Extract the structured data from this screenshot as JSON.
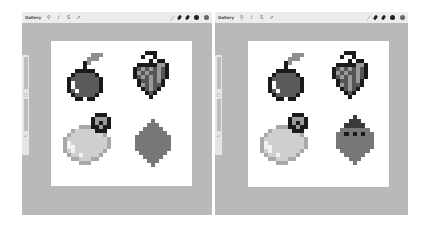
{
  "panes": [
    {
      "id": "left",
      "toolbar": {
        "gallery_label": "Gallery",
        "left_tools": [
          {
            "icon": "wrench-icon",
            "glyph": "⚲"
          },
          {
            "icon": "magic-wand-icon",
            "glyph": "∕"
          },
          {
            "icon": "selection-icon",
            "glyph": "S"
          },
          {
            "icon": "move-arrow-icon",
            "glyph": "➚"
          }
        ],
        "right_tools": [
          {
            "icon": "brush-icon"
          },
          {
            "icon": "smudge-icon"
          },
          {
            "icon": "eraser-icon"
          },
          {
            "icon": "layers-icon"
          },
          {
            "icon": "color-swatch-icon"
          }
        ]
      },
      "sidebar": {
        "brush_size_label": "size",
        "modify_button": "□",
        "opacity_label": "opacity",
        "undo_glyph": "↶"
      },
      "canvas": {
        "sprites": [
          "apple",
          "grapes",
          "pear",
          "leaf"
        ]
      }
    },
    {
      "id": "right",
      "toolbar": {
        "gallery_label": "Gallery",
        "left_tools": [
          {
            "icon": "wrench-icon",
            "glyph": "⚲"
          },
          {
            "icon": "magic-wand-icon",
            "glyph": "∕"
          },
          {
            "icon": "selection-icon",
            "glyph": "S"
          },
          {
            "icon": "move-arrow-icon",
            "glyph": "➚"
          }
        ],
        "right_tools": [
          {
            "icon": "brush-icon"
          },
          {
            "icon": "smudge-icon"
          },
          {
            "icon": "eraser-icon"
          },
          {
            "icon": "layers-icon"
          },
          {
            "icon": "color-swatch-icon"
          }
        ]
      },
      "sidebar": {
        "brush_size_label": "size",
        "modify_button": "□",
        "opacity_label": "opacity",
        "undo_glyph": "↶"
      },
      "canvas": {
        "sprites": [
          "apple",
          "grapes",
          "pear",
          "beetle"
        ]
      }
    }
  ],
  "palette": {
    "workspace": "#b9b9b9",
    "toolbar": "#ececec",
    "canvas": "#ffffff",
    "outline": "#1a1a1a",
    "apple_body": "#5a5a5a",
    "apple_leaf": "#8f8f8f",
    "grape_dark": "#555555",
    "grape_light": "#9a9a9a",
    "pear_body": "#cfcfcf",
    "pear_shade": "#a8a8a8",
    "pear_highlight": "#f2f2f2",
    "leaf_body": "#777777",
    "beetle_head": "#3a3a3a"
  }
}
